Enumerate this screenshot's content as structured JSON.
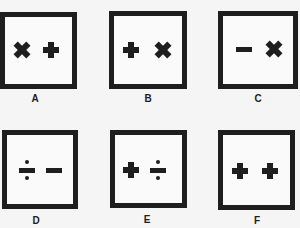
{
  "figure": {
    "type": "symbol-puzzle-options",
    "options": [
      {
        "label": "A",
        "symbols": [
          "times",
          "plus"
        ]
      },
      {
        "label": "B",
        "symbols": [
          "plus",
          "times"
        ]
      },
      {
        "label": "C",
        "symbols": [
          "minus",
          "times"
        ]
      },
      {
        "label": "D",
        "symbols": [
          "divide",
          "minus"
        ]
      },
      {
        "label": "E",
        "symbols": [
          "plus",
          "divide"
        ]
      },
      {
        "label": "F",
        "symbols": [
          "plus",
          "plus"
        ]
      }
    ]
  },
  "colors": {
    "ink": "#1e1e1e",
    "background": "#f5f5f5"
  }
}
